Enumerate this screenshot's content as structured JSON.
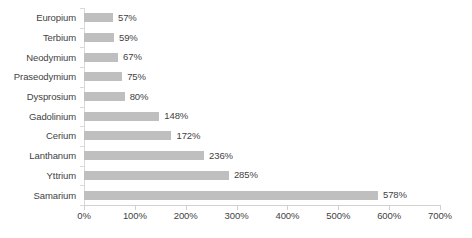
{
  "chart_data": {
    "type": "bar",
    "orientation": "horizontal",
    "title": "",
    "subtitle": "",
    "xlabel": "",
    "ylabel": "",
    "categories": [
      "Europium",
      "Terbium",
      "Neodymium",
      "Praseodymium",
      "Dysprosium",
      "Gadolinium",
      "Cerium",
      "Lanthanum",
      "Yttrium",
      "Samarium"
    ],
    "values": [
      57,
      59,
      67,
      75,
      80,
      148,
      172,
      236,
      285,
      578
    ],
    "data_labels": [
      "57%",
      "59%",
      "67%",
      "75%",
      "80%",
      "148%",
      "172%",
      "236%",
      "285%",
      "578%"
    ],
    "xlim": [
      0,
      700
    ],
    "xticks": [
      0,
      100,
      200,
      300,
      400,
      500,
      600,
      700
    ],
    "xtick_labels": [
      "0%",
      "100%",
      "200%",
      "300%",
      "400%",
      "500%",
      "600%",
      "700%"
    ],
    "grid": false,
    "legend": false,
    "legend_position": "none",
    "series": [
      {
        "name": "",
        "values": [
          57,
          59,
          67,
          75,
          80,
          148,
          172,
          236,
          285,
          578
        ]
      }
    ],
    "colors": {
      "bar_fill": "#bfbfbf",
      "axis_line": "#d0d0d0",
      "text": "#3f3f3f",
      "background": "#ffffff"
    }
  }
}
